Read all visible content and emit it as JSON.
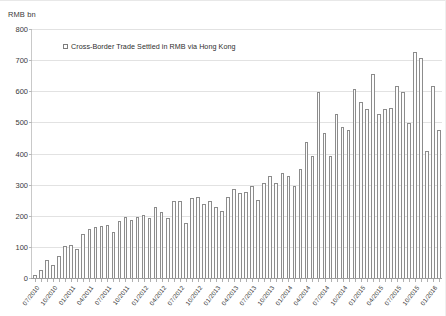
{
  "chart_data": {
    "type": "bar",
    "title": "",
    "subtitle": "",
    "xlabel": "",
    "ylabel": "RMB bn",
    "ylim": [
      0,
      800
    ],
    "yticks": [
      0,
      100,
      200,
      300,
      400,
      500,
      600,
      700,
      800
    ],
    "grid": true,
    "legend_position": "top-left",
    "legend": [
      "Cross-Border Trade Settled in RMB via Hong Kong"
    ],
    "series": [
      {
        "name": "Cross-Border Trade Settled in RMB via Hong Kong",
        "values": [
          12,
          30,
          62,
          45,
          75,
          107,
          110,
          97,
          145,
          160,
          168,
          170,
          175,
          150,
          185,
          200,
          190,
          200,
          205,
          195,
          230,
          215,
          195,
          250,
          250,
          180,
          260,
          265,
          240,
          250,
          230,
          220,
          265,
          290,
          275,
          280,
          300,
          255,
          310,
          330,
          310,
          340,
          330,
          300,
          355,
          440,
          395,
          600,
          470,
          395,
          530,
          490,
          480,
          610,
          570,
          545,
          660,
          530,
          545,
          550,
          620,
          600,
          500,
          730,
          710,
          410,
          620,
          480
        ]
      }
    ],
    "categories": [
      "07/2010",
      "08/2010",
      "09/2010",
      "10/2010",
      "11/2010",
      "12/2010",
      "01/2011",
      "02/2011",
      "03/2011",
      "04/2011",
      "05/2011",
      "06/2011",
      "07/2011",
      "08/2011",
      "09/2011",
      "10/2011",
      "11/2011",
      "12/2011",
      "01/2012",
      "02/2012",
      "03/2012",
      "04/2012",
      "05/2012",
      "06/2012",
      "07/2012",
      "08/2012",
      "09/2012",
      "10/2012",
      "11/2012",
      "12/2012",
      "01/2013",
      "02/2013",
      "03/2013",
      "04/2013",
      "05/2013",
      "06/2013",
      "07/2013",
      "08/2013",
      "09/2013",
      "10/2013",
      "11/2013",
      "12/2013",
      "01/2014",
      "02/2014",
      "03/2014",
      "04/2014",
      "05/2014",
      "06/2014",
      "07/2014",
      "08/2014",
      "09/2014",
      "10/2014",
      "11/2014",
      "12/2014",
      "01/2015",
      "02/2015",
      "03/2015",
      "04/2015",
      "05/2015",
      "06/2015",
      "07/2015",
      "08/2015",
      "09/2015",
      "10/2015",
      "11/2015",
      "12/2015",
      "01/2016",
      "02/2016"
    ],
    "tick_labels": [
      "07/2010",
      "10/2010",
      "01/2011",
      "04/2011",
      "07/2011",
      "10/2011",
      "01/2012",
      "04/2012",
      "07/2012",
      "10/2012",
      "01/2013",
      "04/2013",
      "07/2013",
      "10/2013",
      "01/2014",
      "04/2014",
      "07/2014",
      "10/2014",
      "01/2015",
      "04/2015",
      "07/2015",
      "10/2015",
      "01/2016"
    ],
    "tick_every": 3,
    "colors": {
      "bar_fill": "#fdfdfd",
      "bar_border": "#8c8c8c",
      "gridline": "#e2e2e2",
      "axis": "#9e9e9e",
      "text": "#333333",
      "background": "#ffffff"
    }
  }
}
